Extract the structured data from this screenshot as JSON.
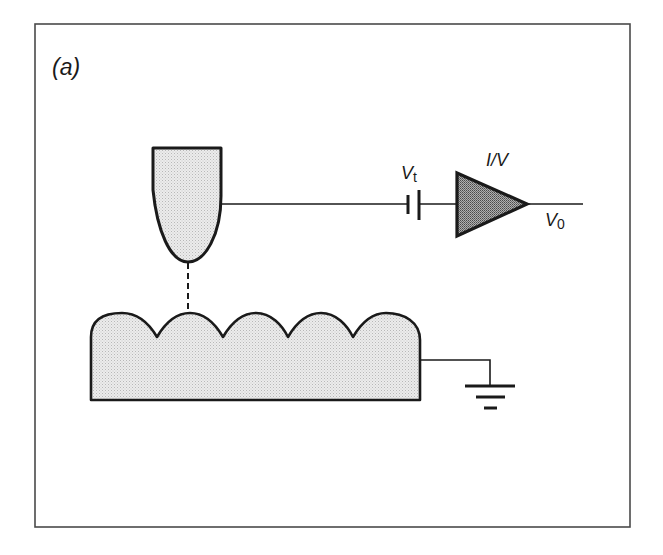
{
  "figure": {
    "panel_label": "(a)",
    "colors": {
      "frame": "#4a4a4a",
      "stroke": "#1a1a1a",
      "tip_fill": "#e6e6e6",
      "sample_fill": "#e2e2e2",
      "amplifier_fill": "#8c8c8c",
      "background": "#ffffff"
    },
    "labels": {
      "bias_voltage": "V",
      "bias_voltage_sub": "t",
      "amplifier": "I/V",
      "output_voltage": "V",
      "output_voltage_sub": "0"
    },
    "components": [
      {
        "name": "tip",
        "description": "STM tip"
      },
      {
        "name": "tunneling-gap",
        "description": "dashed tunneling path between tip and sample"
      },
      {
        "name": "sample",
        "description": "sample surface with 5 atomic bumps"
      },
      {
        "name": "bias-battery",
        "label": "Vt"
      },
      {
        "name": "current-voltage-amplifier",
        "label": "I/V"
      },
      {
        "name": "output",
        "label": "V0"
      },
      {
        "name": "ground",
        "description": "ground symbol"
      }
    ],
    "surface_bump_count": 5
  }
}
